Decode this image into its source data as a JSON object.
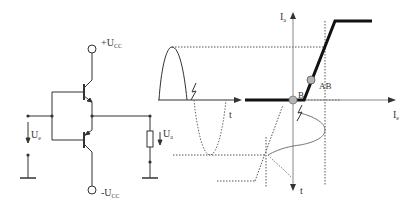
{
  "circuit": {
    "supply_positive": {
      "main": "+U",
      "sub": "CC"
    },
    "supply_negative": {
      "main": "-U",
      "sub": "CC"
    },
    "input_voltage": {
      "main": "U",
      "sub": "e"
    },
    "output_voltage": {
      "main": "U",
      "sub": "a"
    }
  },
  "input_waveform": {
    "time_axis_label": "t"
  },
  "transfer_characteristic": {
    "y_axis_label": {
      "main": "I",
      "sub": "a"
    },
    "x_axis_label": {
      "main": "I",
      "sub": "e"
    },
    "time_axis_label": "t",
    "operating_points": [
      {
        "label": "B"
      },
      {
        "label": "AB"
      }
    ]
  },
  "colors": {
    "line": "#333333",
    "thick_line": "#111111",
    "dotted": "#555555",
    "point_fill": "#b5b5b5",
    "axis_gray": "#888888"
  }
}
